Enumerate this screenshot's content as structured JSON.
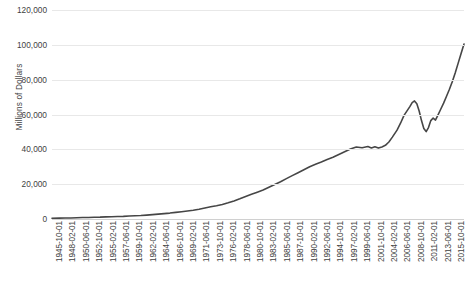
{
  "chart_data": {
    "type": "line",
    "title": "",
    "xlabel": "",
    "ylabel": "Millions of Dollars",
    "ylim": [
      0,
      120000
    ],
    "grid": true,
    "legend": "none",
    "line_color": "#464646",
    "y_ticks": [
      0,
      20000,
      40000,
      60000,
      80000,
      100000,
      120000
    ],
    "y_tick_labels": [
      "0",
      "20,000",
      "40,000",
      "60,000",
      "80,000",
      "100,000",
      "120,000"
    ],
    "x_tick_labels": [
      "1945-10-01",
      "1948-02-01",
      "1950-06-01",
      "1952-10-01",
      "1955-02-01",
      "1957-06-01",
      "1959-10-01",
      "1962-02-01",
      "1964-06-01",
      "1966-10-01",
      "1969-02-01",
      "1971-06-01",
      "1973-10-01",
      "1976-02-01",
      "1978-06-01",
      "1980-10-01",
      "1983-02-01",
      "1985-06-01",
      "1987-10-01",
      "1990-02-01",
      "1992-06-01",
      "1994-10-01",
      "1997-02-01",
      "1999-06-01",
      "2001-10-01",
      "2004-02-01",
      "2006-06-01",
      "2008-10-01",
      "2011-02-01",
      "2013-06-01",
      "2015-10-01"
    ],
    "x_tick_interval_months": 28,
    "x_start": "1945-10-01",
    "x_end": "2016-06-01",
    "x": [
      1945.75,
      1947.0,
      1948.0,
      1949.0,
      1950.0,
      1951.0,
      1952.0,
      1953.0,
      1954.0,
      1955.0,
      1956.0,
      1957.0,
      1958.0,
      1959.0,
      1960.0,
      1961.0,
      1962.0,
      1963.0,
      1964.0,
      1965.0,
      1966.0,
      1967.0,
      1968.0,
      1969.0,
      1970.0,
      1971.0,
      1972.0,
      1973.0,
      1974.0,
      1975.0,
      1976.0,
      1977.0,
      1978.0,
      1979.0,
      1980.0,
      1981.0,
      1982.0,
      1983.0,
      1984.0,
      1985.0,
      1986.0,
      1987.0,
      1988.0,
      1989.0,
      1990.0,
      1991.0,
      1992.0,
      1993.0,
      1994.0,
      1995.0,
      1996.0,
      1997.0,
      1998.0,
      1999.0,
      2000.0,
      2000.6,
      2001.2,
      2001.8,
      2002.4,
      2003.0,
      2003.6,
      2004.2,
      2005.0,
      2005.6,
      2006.2,
      2006.8,
      2007.2,
      2007.6,
      2008.0,
      2008.4,
      2008.8,
      2009.2,
      2009.6,
      2010.0,
      2010.4,
      2010.8,
      2011.2,
      2011.6,
      2012.0,
      2012.5,
      2013.0,
      2013.5,
      2014.0,
      2014.5,
      2015.0,
      2015.5,
      2016.0,
      2016.5
    ],
    "values": [
      420,
      500,
      560,
      600,
      700,
      820,
      900,
      980,
      1050,
      1200,
      1300,
      1400,
      1500,
      1700,
      1850,
      2000,
      2250,
      2500,
      2800,
      3100,
      3400,
      3800,
      4200,
      4600,
      5000,
      5600,
      6300,
      7000,
      7600,
      8300,
      9300,
      10400,
      11600,
      12900,
      14200,
      15400,
      16600,
      18200,
      19800,
      21400,
      23200,
      24900,
      26600,
      28300,
      30000,
      31400,
      32700,
      34100,
      35400,
      37000,
      38600,
      40200,
      41300,
      40900,
      41600,
      40800,
      41500,
      40700,
      41400,
      42300,
      44200,
      47000,
      51000,
      55000,
      59500,
      62500,
      64500,
      66800,
      67800,
      66200,
      62000,
      56500,
      52000,
      50200,
      52500,
      56500,
      58000,
      56800,
      59500,
      63000,
      66500,
      70500,
      74500,
      79000,
      84000,
      89500,
      95000,
      100500
    ],
    "series_name": "Millions of Dollars",
    "notes_peak_2007": 67800,
    "notes_trough_2010": 50200,
    "notes_final": 100500
  }
}
